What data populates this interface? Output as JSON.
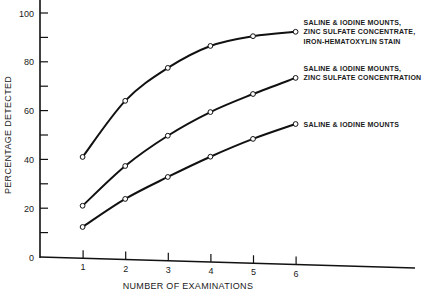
{
  "chart_data": {
    "type": "line",
    "title": "",
    "xlabel": "NUMBER OF EXAMINATIONS",
    "ylabel": "PERCENTAGE DETECTED",
    "x": [
      1,
      2,
      3,
      4,
      5,
      6
    ],
    "xticks": [
      "1",
      "2",
      "3",
      "4",
      "5",
      "6"
    ],
    "yticks": [
      "0",
      "20",
      "40",
      "60",
      "80",
      "100"
    ],
    "ytick_values": [
      0,
      20,
      40,
      60,
      80,
      100
    ],
    "yminor_values": [
      10,
      30,
      50,
      70,
      90
    ],
    "xlim": [
      0,
      8.9
    ],
    "ylim": [
      0,
      100
    ],
    "grid": false,
    "legend": "inline-right",
    "series": [
      {
        "name": "Saline & Iodine Mounts, Zinc Sulfate Concentrate, Iron-Hematoxylin Stain",
        "label_lines": [
          "SALINE & IODINE MOUNTS,",
          "ZINC SULFATE CONCENTRATE,",
          "IRON-HEMATOXYLIN STAIN"
        ],
        "values": [
          41,
          64,
          77.5,
          86.5,
          90.5,
          92.3
        ]
      },
      {
        "name": "Saline & Iodine Mounts, Zinc Sulfate Concentration",
        "label_lines": [
          "SALINE & IODINE MOUNTS,",
          "ZINC SULFATE CONCENTRATION"
        ],
        "values": [
          21,
          37.3,
          49.7,
          59.4,
          66.8,
          73.4
        ]
      },
      {
        "name": "Saline & Iodine Mounts",
        "label_lines": [
          "SALINE & IODINE MOUNTS"
        ],
        "values": [
          12.3,
          23.8,
          32.8,
          41.1,
          48.4,
          54.5
        ]
      }
    ]
  }
}
